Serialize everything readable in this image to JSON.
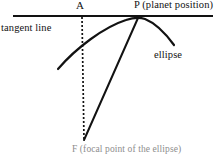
{
  "figure": {
    "background_color": "#ffffff",
    "ink_color": "#121212",
    "labels": {
      "point_a": "A",
      "point_p": "P (planet position)",
      "tangent_line": "tangent line",
      "ellipse": "ellipse",
      "focal_point": "F (focal point of the ellipse)"
    },
    "geometry": {
      "tangent_line": {
        "type": "line",
        "x1": 13,
        "y1": 16,
        "x2": 213,
        "y2": 16,
        "stroke_width": 2.2
      },
      "dotted_vertical": {
        "type": "dotted-line",
        "x1": 82,
        "y1": 17,
        "x2": 84,
        "y2": 140,
        "dash": "2 2",
        "stroke_width": 1.6
      },
      "focal_radius": {
        "type": "line",
        "x1": 84,
        "y1": 140,
        "x2": 138,
        "y2": 18,
        "stroke_width": 2.0
      },
      "ellipse_arc": {
        "type": "arc",
        "path": "M 58,69 C 76,48 104,27 126,20 C 133,17.6 139,16.8 145,19 C 155,23 166,34 174,45",
        "stroke_width": 2.2,
        "tangent_point": {
          "x": 138,
          "y": 17
        }
      }
    }
  }
}
